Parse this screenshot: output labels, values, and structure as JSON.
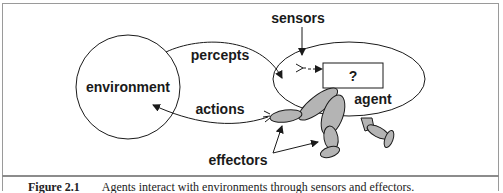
{
  "diagram": {
    "nodes": {
      "environment": "environment",
      "agent": "agent",
      "unknown_box": "?"
    },
    "labels": {
      "percepts": "percepts",
      "actions": "actions",
      "sensors": "sensors",
      "effectors": "effectors"
    },
    "colors": {
      "stroke": "#1a1a1a",
      "limb_fill": "#b4b4b4",
      "frame": "#9a9a9a"
    }
  },
  "caption": {
    "figure_number": "Figure 2.1",
    "text": "Agents interact with environments through sensors and effectors."
  }
}
